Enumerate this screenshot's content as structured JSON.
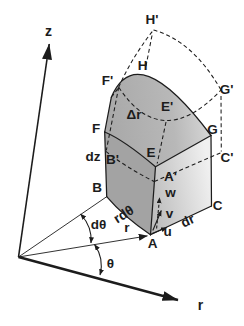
{
  "figure": {
    "background_color": "#ffffff",
    "line_color": "#1c1c1c",
    "faces": {
      "front_color": "#a3a3a3",
      "top_color_left": "#a9a9a9",
      "top_color_right": "#dadada",
      "side_color_left": "#bdbdbd",
      "side_color_right": "#f0f0f0"
    },
    "axes": {
      "z": "z",
      "r": "r"
    },
    "angles": {
      "theta": "θ",
      "dtheta": "dθ"
    },
    "dimensions": {
      "r": "r",
      "r_dtheta": "rdθ",
      "dr": "dr",
      "dz": "dz",
      "delta_r": "Δr"
    },
    "vectors": {
      "u": "u",
      "v": "v",
      "w": "w"
    },
    "points": {
      "A": "A",
      "A_prime": "A'",
      "B": "B",
      "B_prime": "B'",
      "C": "C",
      "C_prime": "C'",
      "E": "E",
      "E_prime": "E'",
      "F": "F",
      "F_prime": "F'",
      "G": "G",
      "G_prime": "G'",
      "H": "H",
      "H_prime": "H'"
    }
  }
}
